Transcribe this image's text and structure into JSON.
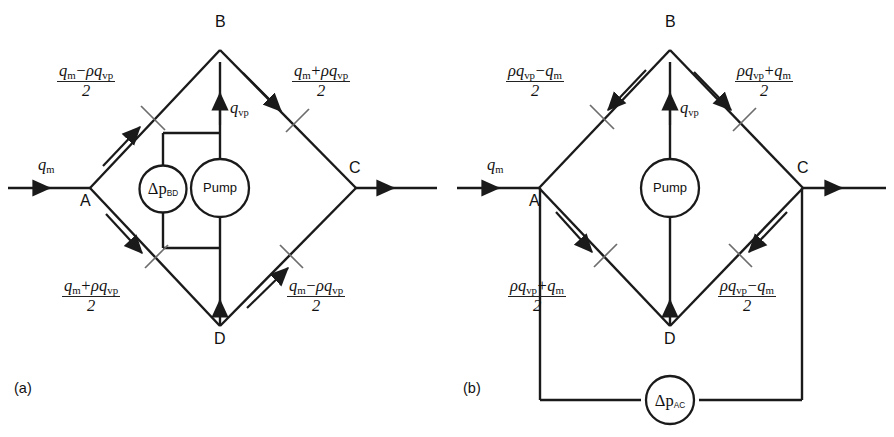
{
  "figure": {
    "kind": "engineering-schematic",
    "background_color": "#ffffff",
    "line_color": "#1a1a1a",
    "tick_color": "#6d6d6d"
  },
  "panels": [
    {
      "id": "a",
      "caption": "(a)",
      "nodes": [
        {
          "id": "A",
          "label": "A"
        },
        {
          "id": "B",
          "label": "B"
        },
        {
          "id": "C",
          "label": "C"
        },
        {
          "id": "D",
          "label": "D"
        }
      ],
      "inlet_label": "q_m",
      "inlet_label_parts": {
        "base": "q",
        "sub": "m"
      },
      "center_label_parts": {
        "base": "q",
        "sub": "vp"
      },
      "meters": [
        {
          "id": "dp-bd",
          "kind": "pressure-difference",
          "base": "Δp",
          "sub": "BD"
        },
        {
          "id": "pump",
          "kind": "pump",
          "text": "Pump"
        }
      ],
      "branch_labels": [
        {
          "position": "top-left",
          "numerator": [
            {
              "t": "q",
              "i": true
            },
            {
              "t": "m",
              "sub": true
            },
            {
              "t": "−",
              "op": true
            },
            {
              "t": "ρ",
              "i": true
            },
            {
              "t": "q",
              "i": true
            },
            {
              "t": "vp",
              "sub": true
            }
          ],
          "denominator": "2",
          "plain": "(q_m - rho q_vp)/2"
        },
        {
          "position": "top-right",
          "numerator": [
            {
              "t": "q",
              "i": true
            },
            {
              "t": "m",
              "sub": true
            },
            {
              "t": "+",
              "op": true
            },
            {
              "t": "ρ",
              "i": true
            },
            {
              "t": "q",
              "i": true
            },
            {
              "t": "vp",
              "sub": true
            }
          ],
          "denominator": "2",
          "plain": "(q_m + rho q_vp)/2"
        },
        {
          "position": "bottom-left",
          "numerator": [
            {
              "t": "q",
              "i": true
            },
            {
              "t": "m",
              "sub": true
            },
            {
              "t": "+",
              "op": true
            },
            {
              "t": "ρ",
              "i": true
            },
            {
              "t": "q",
              "i": true
            },
            {
              "t": "vp",
              "sub": true
            }
          ],
          "denominator": "2",
          "plain": "(q_m + rho q_vp)/2"
        },
        {
          "position": "bottom-right",
          "numerator": [
            {
              "t": "q",
              "i": true
            },
            {
              "t": "m",
              "sub": true
            },
            {
              "t": "−",
              "op": true
            },
            {
              "t": "ρ",
              "i": true
            },
            {
              "t": "q",
              "i": true
            },
            {
              "t": "vp",
              "sub": true
            }
          ],
          "denominator": "2",
          "plain": "(q_m - rho q_vp)/2"
        }
      ]
    },
    {
      "id": "b",
      "caption": "(b)",
      "nodes": [
        {
          "id": "A",
          "label": "A"
        },
        {
          "id": "B",
          "label": "B"
        },
        {
          "id": "C",
          "label": "C"
        },
        {
          "id": "D",
          "label": "D"
        }
      ],
      "inlet_label_parts": {
        "base": "q",
        "sub": "m"
      },
      "center_label_parts": {
        "base": "q",
        "sub": "vp"
      },
      "meters": [
        {
          "id": "pump",
          "kind": "pump",
          "text": "Pump"
        },
        {
          "id": "dp-ac",
          "kind": "pressure-difference",
          "base": "Δp",
          "sub": "AC"
        }
      ],
      "branch_labels": [
        {
          "position": "top-left",
          "numerator": [
            {
              "t": "ρ",
              "i": true
            },
            {
              "t": "q",
              "i": true
            },
            {
              "t": "vp",
              "sub": true
            },
            {
              "t": "−",
              "op": true
            },
            {
              "t": "q",
              "i": true
            },
            {
              "t": "m",
              "sub": true
            }
          ],
          "denominator": "2",
          "plain": "(rho q_vp - q_m)/2"
        },
        {
          "position": "top-right",
          "numerator": [
            {
              "t": "ρ",
              "i": true
            },
            {
              "t": "q",
              "i": true
            },
            {
              "t": "vp",
              "sub": true
            },
            {
              "t": "+",
              "op": true
            },
            {
              "t": "q",
              "i": true
            },
            {
              "t": "m",
              "sub": true
            }
          ],
          "denominator": "2",
          "plain": "(rho q_vp + q_m)/2"
        },
        {
          "position": "bottom-left",
          "numerator": [
            {
              "t": "ρ",
              "i": true
            },
            {
              "t": "q",
              "i": true
            },
            {
              "t": "vp",
              "sub": true
            },
            {
              "t": "+",
              "op": true
            },
            {
              "t": "q",
              "i": true
            },
            {
              "t": "m",
              "sub": true
            }
          ],
          "denominator": "2",
          "plain": "(rho q_vp + q_m)/2"
        },
        {
          "position": "bottom-right",
          "numerator": [
            {
              "t": "ρ",
              "i": true
            },
            {
              "t": "q",
              "i": true
            },
            {
              "t": "vp",
              "sub": true
            },
            {
              "t": "−",
              "op": true
            },
            {
              "t": "q",
              "i": true
            },
            {
              "t": "m",
              "sub": true
            }
          ],
          "denominator": "2",
          "plain": "(rho q_vp - q_m)/2"
        }
      ]
    }
  ],
  "text": {
    "a_caption": "(a)",
    "b_caption": "(b)",
    "pump": "Pump",
    "dp_bd_base": "Δp",
    "dp_bd_sub": "BD",
    "dp_ac_base": "Δp",
    "dp_ac_sub": "AC",
    "node_a": "A",
    "node_b": "B",
    "node_c": "C",
    "node_d": "D",
    "q_base": "q",
    "q_m_sub": "m",
    "q_vp_sub": "vp",
    "two": "2",
    "minus": "−",
    "plus": "+",
    "rho": "ρ"
  }
}
